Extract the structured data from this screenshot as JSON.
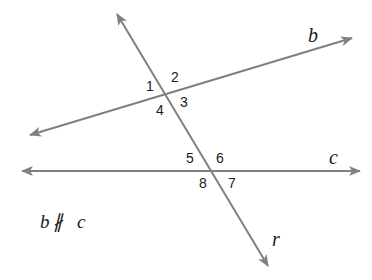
{
  "diagram": {
    "line_color": "#808080",
    "text_color": "#1a1a1a",
    "lines": {
      "b": {
        "label": "b",
        "x1": 30,
        "y1": 135,
        "x2": 352,
        "y2": 38
      },
      "c": {
        "label": "c",
        "x1": 22,
        "y1": 171,
        "x2": 360,
        "y2": 171
      },
      "r": {
        "label": "r",
        "x1": 117,
        "y1": 14,
        "x2": 268,
        "y2": 266
      }
    },
    "angles": [
      "1",
      "2",
      "3",
      "4",
      "5",
      "6",
      "7",
      "8"
    ],
    "note": {
      "left": "b",
      "symbol": "∦",
      "right": "c"
    }
  }
}
